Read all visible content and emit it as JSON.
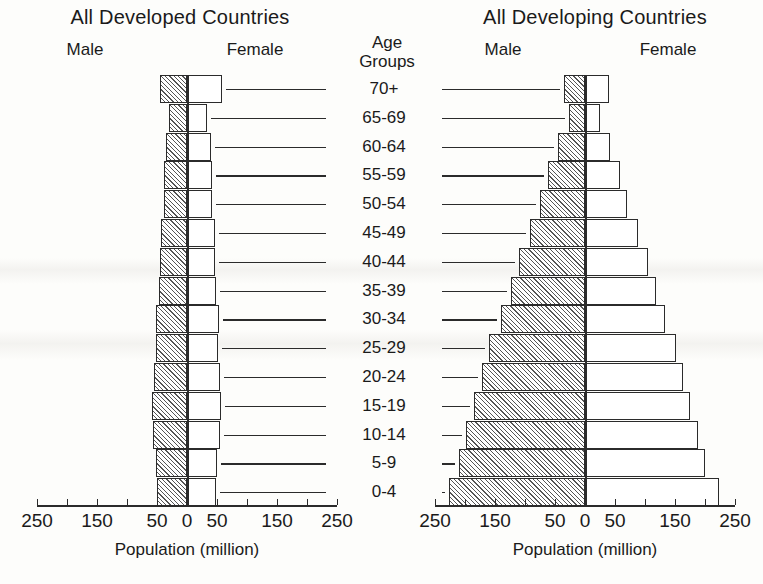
{
  "left_panel": {
    "title": "All Developed Countries",
    "male_label": "Male",
    "female_label": "Female",
    "axis_title": "Population (million)"
  },
  "right_panel": {
    "title": "All Developing Countries",
    "male_label": "Male",
    "female_label": "Female",
    "axis_title": "Population (million)"
  },
  "age_header": {
    "line1": "Age",
    "line2": "Groups"
  },
  "axis": {
    "tick_labels": [
      "250",
      "150",
      "50",
      "0",
      "50",
      "150",
      "250"
    ],
    "tick_values": [
      -250,
      -150,
      -50,
      0,
      50,
      150,
      250
    ],
    "minor_tick_values": [
      -250,
      -200,
      -150,
      -100,
      -50,
      0,
      50,
      100,
      150,
      200,
      250
    ],
    "max": 250,
    "units": "million"
  },
  "age_groups": [
    "70+",
    "65-69",
    "60-64",
    "55-59",
    "50-54",
    "45-49",
    "40-44",
    "35-39",
    "30-34",
    "25-29",
    "20-24",
    "15-19",
    "10-14",
    "5-9",
    "0-4"
  ],
  "colors": {
    "male_hatch": "#555555",
    "female_fill": "#ffffff",
    "outline": "#2b2b2b",
    "background": "#fdfdfb"
  },
  "chart_data": {
    "type": "bar",
    "subtype": "population-pyramid",
    "xlabel": "Population (million)",
    "ylabel": "Age Groups",
    "xlim": [
      -250,
      250
    ],
    "grid": false,
    "legend": [
      "Male",
      "Female"
    ],
    "categories": [
      "70+",
      "65-69",
      "60-64",
      "55-59",
      "50-54",
      "45-49",
      "40-44",
      "35-39",
      "30-34",
      "25-29",
      "20-24",
      "15-19",
      "10-14",
      "5-9",
      "0-4"
    ],
    "panels": [
      {
        "name": "All Developed Countries",
        "series": [
          {
            "name": "Male",
            "values": [
              45,
              30,
              35,
              38,
              38,
              43,
              45,
              47,
              52,
              52,
              55,
              58,
              57,
              52,
              50
            ]
          },
          {
            "name": "Female",
            "values": [
              58,
              33,
              40,
              42,
              42,
              46,
              47,
              49,
              53,
              52,
              55,
              57,
              55,
              50,
              48
            ]
          }
        ]
      },
      {
        "name": "All Developing Countries",
        "series": [
          {
            "name": "Male",
            "values": [
              35,
              27,
              45,
              62,
              75,
              92,
              110,
              123,
              140,
              160,
              172,
              185,
              198,
              210,
              227
            ]
          },
          {
            "name": "Female",
            "values": [
              40,
              25,
              42,
              58,
              70,
              88,
              105,
              118,
              133,
              152,
              163,
              175,
              188,
              200,
              223
            ]
          }
        ]
      }
    ]
  }
}
